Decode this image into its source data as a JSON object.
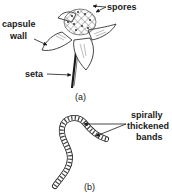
{
  "figure": {
    "panel_a": {
      "caption": "(a)",
      "labels": {
        "spores": "spores",
        "capsule_wall_line1": "capsule",
        "capsule_wall_line2": "wall",
        "seta": "seta"
      }
    },
    "panel_b": {
      "caption": "(b)",
      "labels": {
        "line1": "spirally",
        "line2": "thickened",
        "line3": "bands"
      }
    },
    "colors": {
      "ink": "#1a1a1a",
      "background": "#ffffff"
    }
  }
}
